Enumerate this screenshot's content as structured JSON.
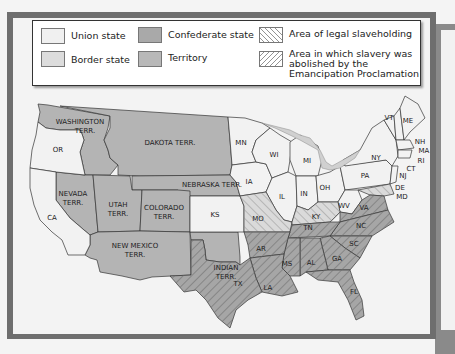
{
  "legend": {
    "items": [
      {
        "label": "Union state",
        "color": "#f0f0f0",
        "pattern": "none"
      },
      {
        "label": "Border state",
        "color": "#dcdcdc",
        "pattern": "none"
      },
      {
        "label": "Confederate state",
        "color": "#a9a9a9",
        "pattern": "none"
      },
      {
        "label": "Territory",
        "color": "#b8b8b8",
        "pattern": "none"
      },
      {
        "label": "Area of legal slaveholding",
        "pattern": "backslash-hatch"
      },
      {
        "label": "Area in which slavery was abolished by the Emancipation Proclamation",
        "pattern": "slash-hatch"
      }
    ],
    "label_lines": {
      "emancipation": [
        "Area in which slavery was",
        "abolished by the",
        "Emancipation Proclamation"
      ]
    }
  },
  "map": {
    "colors": {
      "union": "#f2f2f2",
      "border": "#dadada",
      "confederate": "#a6a6a6",
      "territory": "#b4b4b4",
      "water": "#d0d0d0",
      "outline": "#333333"
    },
    "labels": {
      "washington": [
        "WASHINGTON",
        "TERR."
      ],
      "or": "OR",
      "dakota": "DAKOTA TERR.",
      "mn": "MN",
      "wi": "WI",
      "mi": "MI",
      "ny": "NY",
      "vt": "VT",
      "me": "ME",
      "nh": "NH",
      "ma": "MA",
      "ri": "RI",
      "ct": "CT",
      "nj": "NJ",
      "pa": "PA",
      "de": "DE",
      "md": "MD",
      "ia": "IA",
      "il": "IL",
      "in": "IN",
      "oh": "OH",
      "wv": "WV",
      "va": "VA",
      "ky": "KY",
      "tn": "TN",
      "nc": "NC",
      "sc": "SC",
      "ga": "GA",
      "al": "AL",
      "ms": "MS",
      "ar": "AR",
      "la": "LA",
      "fl": "FL",
      "tx": "TX",
      "indian": [
        "INDIAN",
        "TERR."
      ],
      "ks": "KS",
      "mo": "MO",
      "nebraska": "NEBRASKA TERR.",
      "colorado": [
        "COLORADO",
        "TERR."
      ],
      "utah": [
        "UTAH",
        "TERR."
      ],
      "nevada": [
        "NEVADA",
        "TERR."
      ],
      "ca": "CA",
      "newmexico": [
        "NEW MEXICO",
        "TERR."
      ]
    }
  }
}
